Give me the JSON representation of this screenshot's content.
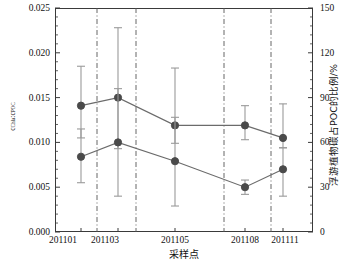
{
  "chart_data": {
    "type": "line",
    "title": "",
    "subtitle": "",
    "xlabel": "采样点",
    "ylabel": "cChla:cPOC",
    "ylabel_base": "c",
    "ylabel_sub1": "Chla",
    "ylabel_mid": ":c",
    "ylabel_sub2": "POC",
    "y2label": "浮游植物碳占POC的比例/%",
    "categories": [
      "201101",
      "201103",
      "201105",
      "201108",
      "201111"
    ],
    "x_tick_labels": [
      "201101",
      "201103",
      "201105",
      "201108",
      "201111"
    ],
    "y_tick_labels": [
      "0.000",
      "0.005",
      "0.010",
      "0.015",
      "0.020",
      "0.025"
    ],
    "y_tick_values": [
      0.0,
      0.005,
      0.01,
      0.015,
      0.02,
      0.025
    ],
    "y2_tick_labels": [
      "0",
      "30",
      "60",
      "90",
      "120",
      "150"
    ],
    "y2_tick_values": [
      0,
      30,
      60,
      90,
      120,
      150
    ],
    "ylim": [
      0.0,
      0.025
    ],
    "y2lim": [
      0,
      150
    ],
    "grid": false,
    "legend": "none",
    "marker": "filled-circle",
    "marker_color": "#4a4a4a",
    "line_color": "#6b6b6b",
    "errorbar_color": "#9a9a9a",
    "divider_style": "dash-dot",
    "divider_color": "#555555",
    "series": [
      {
        "name": "upper",
        "values": [
          0.0141,
          0.015,
          0.0119,
          0.0119,
          0.0105
        ],
        "err_low": [
          0.0105,
          0.0093,
          0.0099,
          0.0103,
          0.0094
        ],
        "err_high": [
          0.0185,
          0.0228,
          0.0183,
          0.0141,
          0.0143
        ]
      },
      {
        "name": "lower",
        "values": [
          0.0084,
          0.01,
          0.0079,
          0.005,
          0.007
        ],
        "err_low": [
          0.0055,
          0.004,
          0.0029,
          0.0042,
          0.004
        ],
        "err_high": [
          0.0115,
          0.016,
          0.0128,
          0.0058,
          0.0094
        ]
      }
    ]
  },
  "axes": {
    "left_ticks": [
      "0.025",
      "0.020",
      "0.015",
      "0.010",
      "0.005",
      "0.000"
    ],
    "right_ticks": [
      "150",
      "120",
      "90",
      "60",
      "30",
      "0"
    ],
    "bottom_ticks": [
      "201101",
      "201103",
      "201105",
      "201108",
      "201111"
    ]
  }
}
